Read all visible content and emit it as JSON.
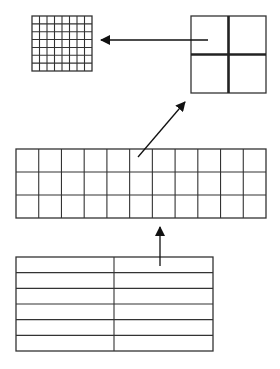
{
  "diagram": {
    "title": "",
    "stroke_color": "#333333",
    "thick_stroke_color": "#222222",
    "background": "#ffffff",
    "nodes": [
      {
        "id": "fine-grid",
        "kind": "grid",
        "columns": 8,
        "rows": 7
      },
      {
        "id": "quad-square",
        "kind": "grid",
        "columns": 2,
        "rows": 2,
        "thick_dividers": true
      },
      {
        "id": "wide-grid",
        "kind": "grid",
        "columns": 11,
        "rows": 3
      },
      {
        "id": "two-column-table",
        "kind": "table",
        "columns": 2,
        "rows": 6
      }
    ],
    "edges": [
      {
        "id": "table-to-wide-grid",
        "from": "two-column-table",
        "to": "wide-grid",
        "direction": "up"
      },
      {
        "id": "wide-grid-to-quad",
        "from": "wide-grid",
        "to": "quad-square",
        "direction": "up-right"
      },
      {
        "id": "quad-to-fine-grid",
        "from": "quad-square",
        "to": "fine-grid",
        "direction": "left"
      }
    ]
  }
}
